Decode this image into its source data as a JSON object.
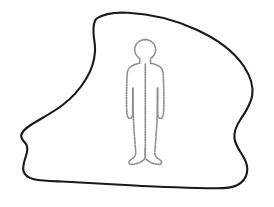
{
  "scene": {
    "title": "Person inside irregular boundary outline",
    "description": "A black hand-drawn irregular closed blob shape containing a dotted gray outline of a standing human figure",
    "canvas": {
      "width": 274,
      "height": 207,
      "background_color": "#ffffff"
    }
  },
  "shapes": {
    "blob": {
      "name": "irregular-boundary",
      "stroke_color": "#1a1a1a",
      "stroke_width": 2.1,
      "fill_color": "#ffffff",
      "style": "solid",
      "path": "M 96.5 18.5 C 104 13.5 116 12.2 128 12.8 C 150 13.9 174 19.5 196 29.5 C 216 38.5 234 51.5 244 66.5 C 251 77.2 253.6 86.5 252.2 95.5 C 250.8 104.5 245.5 112 240.5 119.5 C 236.5 125.5 233.5 131.5 234.5 138.5 C 235.5 145.5 240 151 243.5 157 C 246.5 162.2 248 167.5 247 172.5 C 246 178 242.5 182.5 237 185.2 C 231 188.1 223 188.4 215 188.3 C 190 188 160 186.8 130 185.2 C 106 183.9 82 182.4 62 181.5 C 50 181 41 180.8 34 179.2 C 28 177.8 24.5 175.2 23.5 171 C 22.5 166.8 24 162 25.5 157.5 C 27 153 28.5 149 26.5 145 C 24.5 141 20.8 139.5 21.2 135.5 C 21.6 131.2 26 128 31.5 124.5 C 40 119 52 113 62 105.5 C 72 98 80 89 86 79 C 91.5 70 94.5 60.5 95 51.5 C 95.4 44.5 93.8 38.8 93.5 33.5 C 93.2 27.5 93.8 21.2 96.5 18.5 Z"
    },
    "figure": {
      "name": "human-silhouette",
      "stroke_color": "#8f8f8f",
      "stroke_width": 1.7,
      "fill_color": "none",
      "style": "dotted",
      "paths": [
        "M 145.2 39.6 C 151.2 39.6 155.6 44.2 155.6 49.6 C 155.6 53.4 153.6 56.5 150.8 58.2 C 150.4 58.6 150.3 59.4 150.4 60.3 L 150.7 63.2 C 153.8 63.8 157.2 65.0 159.5 66.6 C 161.8 68.2 162.8 70.2 163.1 72.8 L 163.6 83.5 L 163.9 97.5 C 164.0 103.0 163.8 110.0 163.4 113.8 C 163.2 116.2 162.5 117.8 161.3 118.3 C 160.1 118.8 158.7 118.2 158.2 116.5 C 157.8 114.8 157.7 111.5 157.7 107.5 L 157.7 88.5",
        "M 145.2 39.6 C 139.2 39.6 134.8 44.2 134.8 49.6 C 134.8 53.4 136.8 56.5 139.6 58.2 C 140.0 58.6 140.1 59.4 140.0 60.3 L 139.7 63.2 C 136.6 63.8 133.2 65.0 130.9 66.6 C 128.6 68.2 127.6 70.2 127.3 72.8 L 126.8 83.5 L 126.5 97.5 C 126.4 103.0 126.6 110.0 127.0 113.8 C 127.2 116.2 127.9 117.8 129.1 118.3 C 130.3 118.8 131.7 118.2 132.2 116.5 C 132.6 114.8 132.7 111.5 132.7 107.5 L 132.7 88.5",
        "M 133.0 88.0 L 133.2 109.0 C 133.3 117.5 133.7 126.5 134.3 134.0 C 134.8 141.0 135.3 146.5 135.6 151.0 C 135.8 154.0 135.5 155.8 134.0 157.2 C 132.6 158.5 130.5 159.5 129.5 161.0 C 128.6 162.4 128.8 163.6 130.2 164.1 C 131.6 164.6 134.2 164.4 137.2 163.4 C 140.0 162.5 142.6 161.0 144.2 159.3 C 145.1 158.3 145.3 157.4 145.3 155.8 L 145.3 148.0",
        "M 157.5 88.0 L 157.3 109.0 C 157.2 117.5 156.8 126.5 156.2 134.0 C 155.7 141.0 155.2 146.5 154.9 151.0 C 154.7 154.0 155.0 155.8 156.5 157.2 C 157.9 158.5 160.0 159.5 161.0 161.0 C 161.9 162.4 161.7 163.6 160.3 164.1 C 158.9 164.6 156.3 164.4 153.3 163.4 C 150.5 162.5 147.9 161.0 146.3 159.3 C 145.4 158.3 145.2 157.4 145.2 155.8 L 145.2 148.0",
        "M 145.3 64.0 L 145.3 96.0 L 145.3 124.0 L 145.3 148.0"
      ]
    }
  },
  "labels": {
    "figure_label": "",
    "blob_label": ""
  }
}
